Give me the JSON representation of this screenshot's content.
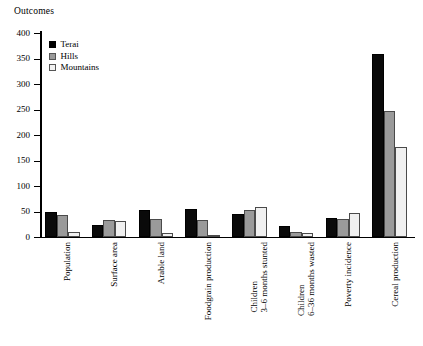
{
  "axis_title": "Outcomes",
  "legend": {
    "position": "top-left-inside",
    "entries": [
      {
        "name": "Terai",
        "color": "#000000"
      },
      {
        "name": "Hills",
        "color": "#9a9a9a"
      },
      {
        "name": "Mountains",
        "color": "#f0f0f0"
      }
    ]
  },
  "yticks": [
    "400",
    "350",
    "300",
    "250",
    "200",
    "150",
    "100",
    "50",
    "0"
  ],
  "chart_data": {
    "type": "bar",
    "title": "",
    "xlabel": "",
    "ylabel": "Outcomes",
    "ylim": [
      0,
      400
    ],
    "ytick_step": 50,
    "grid": false,
    "legend_position": "top-left-inside",
    "categories": [
      "Population",
      "Surface area",
      "Arable land",
      "Foodgrain production",
      "Children 3–6 months stunted",
      "Children 6–36 months wasted",
      "Poverty incidence",
      "Cereal production"
    ],
    "category_lines": [
      [
        "Population"
      ],
      [
        "Surface area"
      ],
      [
        "Arable land"
      ],
      [
        "Foodgrain production"
      ],
      [
        "Children",
        "3–6 months stunted"
      ],
      [
        "Children",
        "6–36 months wasted"
      ],
      [
        "Poverty incidence"
      ],
      [
        "Cereal production"
      ]
    ],
    "series": [
      {
        "name": "Terai",
        "color": "#000000",
        "values": [
          49,
          23,
          53,
          54,
          45,
          22,
          38,
          358
        ]
      },
      {
        "name": "Hills",
        "color": "#9a9a9a",
        "values": [
          43,
          34,
          36,
          34,
          52,
          9,
          36,
          248
        ]
      },
      {
        "name": "Mountains",
        "color": "#f0f0f0",
        "values": [
          9,
          32,
          7,
          4,
          58,
          8,
          48,
          177
        ]
      }
    ]
  }
}
